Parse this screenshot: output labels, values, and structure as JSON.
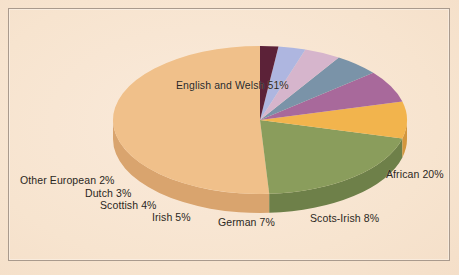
{
  "figure": {
    "background_color": "#f7e4cf",
    "frame_color": "#a99a8d",
    "text_color": "#2b2722"
  },
  "chart_data": {
    "type": "pie",
    "title": "",
    "subtitle": "",
    "xlabel": "",
    "ylabel": "",
    "style": "3d-pie",
    "legend_position": "none",
    "labels_inline": true,
    "grid": false,
    "total_percent": 100,
    "categories": [
      "English and Welsh",
      "African",
      "Scots-Irish",
      "German",
      "Irish",
      "Scottish",
      "Dutch",
      "Other European"
    ],
    "values": [
      51,
      20,
      8,
      7,
      5,
      4,
      3,
      2
    ],
    "colors": [
      "#f0c08a",
      "#8a9d5b",
      "#f2b44e",
      "#a8699b",
      "#7a93a8",
      "#d6b5cc",
      "#aeb6e0",
      "#5c2038"
    ],
    "side_colors": [
      "#d9a46e",
      "#6e804a",
      "#d3963c",
      "#8a5280",
      "#62788b",
      "#b795ad",
      "#8f97c4",
      "#40121f"
    ],
    "slices": [
      {
        "label": "English and Welsh",
        "value": 51,
        "display": "English and Welsh 51%",
        "color": "#f0c08a"
      },
      {
        "label": "African",
        "value": 20,
        "display": "African 20%",
        "color": "#8a9d5b"
      },
      {
        "label": "Scots-Irish",
        "value": 8,
        "display": "Scots-Irish 8%",
        "color": "#f2b44e"
      },
      {
        "label": "German",
        "value": 7,
        "display": "German 7%",
        "color": "#a8699b"
      },
      {
        "label": "Irish",
        "value": 5,
        "display": "Irish 5%",
        "color": "#7a93a8"
      },
      {
        "label": "Scottish",
        "value": 4,
        "display": "Scottish 4%",
        "color": "#d6b5cc"
      },
      {
        "label": "Dutch",
        "value": 3,
        "display": "Dutch 3%",
        "color": "#aeb6e0"
      },
      {
        "label": "Other European",
        "value": 2,
        "display": "Other European 2%",
        "color": "#5c2038"
      }
    ]
  },
  "labels": {
    "english_and_welsh": "English and Welsh 51%",
    "african": "African 20%",
    "scots_irish": "Scots-Irish 8%",
    "german": "German 7%",
    "irish": "Irish 5%",
    "scottish": "Scottish 4%",
    "dutch": "Dutch 3%",
    "other_european": "Other European 2%"
  }
}
